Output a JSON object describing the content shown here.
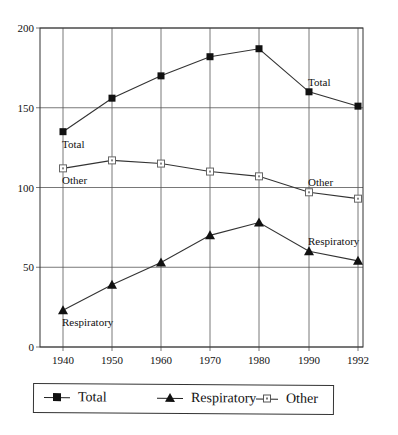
{
  "chart_data": {
    "type": "line",
    "title": "",
    "xlabel": "",
    "ylabel": "",
    "categories": [
      "1940",
      "1950",
      "1960",
      "1970",
      "1980",
      "1990",
      "1992"
    ],
    "yticks": [
      "0",
      "50",
      "100",
      "150",
      "200"
    ],
    "ylim": [
      0,
      200
    ],
    "grid": true,
    "legend_position": "bottom",
    "series": [
      {
        "name": "Total",
        "marker": "filled-square",
        "values": [
          135,
          156,
          170,
          182,
          187,
          160,
          151
        ]
      },
      {
        "name": "Respiratory",
        "marker": "filled-triangle",
        "values": [
          23,
          39,
          53,
          70,
          78,
          60,
          54
        ]
      },
      {
        "name": "Other",
        "marker": "open-square",
        "values": [
          112,
          117,
          115,
          110,
          107,
          97,
          93
        ]
      }
    ],
    "annotations": [
      {
        "text": "Total",
        "series": "Total",
        "at": "1940",
        "position": "below"
      },
      {
        "text": "Total",
        "series": "Total",
        "at": "1990",
        "position": "above"
      },
      {
        "text": "Other",
        "series": "Other",
        "at": "1940",
        "position": "below"
      },
      {
        "text": "Other",
        "series": "Other",
        "at": "1990",
        "position": "above"
      },
      {
        "text": "Respiratory",
        "series": "Respiratory",
        "at": "1940",
        "position": "below"
      },
      {
        "text": "Respiratory",
        "series": "Respiratory",
        "at": "1990",
        "position": "above"
      }
    ]
  },
  "legend": {
    "items": [
      {
        "label": "Total"
      },
      {
        "label": "Respiratory"
      },
      {
        "label": "Other"
      }
    ]
  }
}
